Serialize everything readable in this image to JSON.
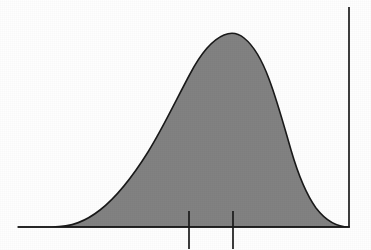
{
  "figure": {
    "title": "",
    "background_color": "#fefefe",
    "curve_fill_color": "#828282",
    "curve_outline_color": "#1a1a1a",
    "axis_color": "#1a1a1a",
    "width": 371,
    "height": 250
  },
  "chart_data": {
    "type": "area",
    "title": "",
    "subtitle": "",
    "xlabel": "",
    "ylabel": "",
    "grid": false,
    "legend": null,
    "legend_position": "none",
    "xlim": [
      0,
      100
    ],
    "ylim": [
      0,
      1
    ],
    "x": [
      0,
      4,
      9,
      13,
      18,
      22,
      27,
      31,
      36,
      40,
      45,
      49,
      54,
      58,
      63,
      67,
      72,
      76,
      81,
      85,
      90,
      94,
      100
    ],
    "y": [
      0.0,
      0.005,
      0.02,
      0.05,
      0.1,
      0.17,
      0.26,
      0.37,
      0.49,
      0.62,
      0.74,
      0.85,
      0.93,
      0.98,
      1.0,
      0.98,
      0.9,
      0.77,
      0.6,
      0.42,
      0.25,
      0.12,
      0.0
    ],
    "annotations": [
      {
        "name": "tick-marker-1",
        "type": "vertical-tick",
        "x": 0.573,
        "label": ""
      },
      {
        "name": "tick-marker-2",
        "type": "vertical-tick",
        "x": 0.703,
        "label": ""
      }
    ],
    "axes": {
      "baseline": {
        "name": "x-axis",
        "orientation": "horizontal",
        "visible": true,
        "ticks": []
      },
      "vertical": {
        "name": "y-axis",
        "orientation": "vertical",
        "position": "right",
        "visible": true,
        "ticks": []
      }
    }
  },
  "geometry": {
    "baseline_y": 227,
    "baseline_x_start": 18,
    "baseline_x_end": 350,
    "vaxis_x": 349,
    "vaxis_y_top": 7,
    "peak_x": 232,
    "peak_y": 33,
    "curve_left_foot_x": 52,
    "curve_right_foot_x": 349,
    "tick1_x": 189,
    "tick2_x": 233,
    "tick_y_top": 211,
    "tick_y_bottom": 249,
    "curve_path": "M 18 227 L 52 227 C 72 227 86 221 100 210 C 118 196 133 176 148 152 C 163 128 176 100 190 74 C 201 53 212 40 224 35 C 231 32 238 33 244 38 C 254 46 262 60 269 79 C 277 100 284 126 291 150 C 298 174 306 194 316 208 C 326 221 338 227 349 227 Z"
  }
}
